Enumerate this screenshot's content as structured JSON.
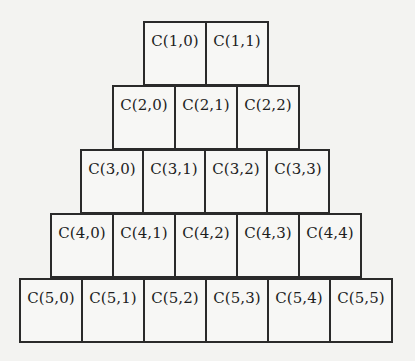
{
  "diagram": {
    "rows": [
      {
        "n": 1,
        "cells": [
          "C(1,0)",
          "C(1,1)"
        ]
      },
      {
        "n": 2,
        "cells": [
          "C(2,0)",
          "C(2,1)",
          "C(2,2)"
        ]
      },
      {
        "n": 3,
        "cells": [
          "C(3,0)",
          "C(3,1)",
          "C(3,2)",
          "C(3,3)"
        ]
      },
      {
        "n": 4,
        "cells": [
          "C(4,0)",
          "C(4,1)",
          "C(4,2)",
          "C(4,3)",
          "C(4,4)"
        ]
      },
      {
        "n": 5,
        "cells": [
          "C(5,0)",
          "C(5,1)",
          "C(5,2)",
          "C(5,3)",
          "C(5,4)",
          "C(5,5)"
        ]
      }
    ]
  },
  "colors": {
    "background": "#f3f3f1",
    "border": "#2a2a2a",
    "text": "#1e1e1e"
  }
}
